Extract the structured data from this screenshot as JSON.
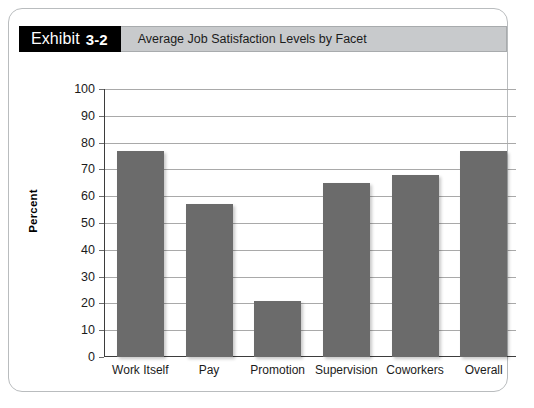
{
  "header": {
    "tag_label": "Exhibit",
    "tag_number": "3-2",
    "title": "Average Job Satisfaction Levels by Facet"
  },
  "colors": {
    "bar_fill": "#6b6b6b",
    "tag_background": "#000000",
    "title_band": "#c8cacc",
    "gridline": "#a9a9a9",
    "axis": "#3d3d3d"
  },
  "chart_data": {
    "type": "bar",
    "title": "Average Job Satisfaction Levels by Facet",
    "xlabel": "",
    "ylabel": "Percent",
    "ylim": [
      0,
      100
    ],
    "ytick_step": 10,
    "yticks": [
      0,
      10,
      20,
      30,
      40,
      50,
      60,
      70,
      80,
      90,
      100
    ],
    "ytick_labels": [
      "0",
      "10",
      "20",
      "30",
      "40",
      "50",
      "60",
      "70",
      "80",
      "90",
      "100"
    ],
    "grid": true,
    "legend": "none",
    "categories": [
      "Work Itself",
      "Pay",
      "Promotion",
      "Supervision",
      "Coworkers",
      "Overall"
    ],
    "values": [
      77,
      57,
      21,
      65,
      68,
      77
    ]
  }
}
